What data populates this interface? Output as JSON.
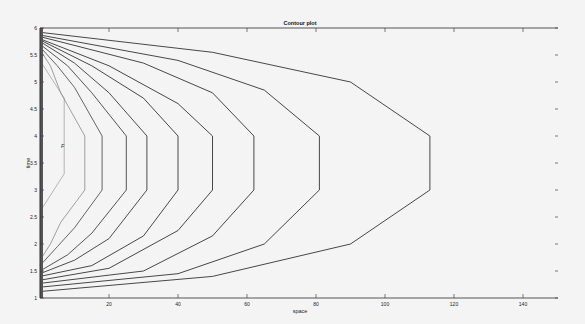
{
  "chart_data": {
    "type": "contour",
    "title": "Contour plot",
    "xlabel": "space",
    "ylabel": "time",
    "xlim": [
      0,
      150
    ],
    "ylim": [
      1,
      6
    ],
    "xticks": [
      20,
      40,
      60,
      80,
      100,
      120,
      140
    ],
    "yticks": [
      1,
      1.5,
      2,
      2.5,
      3,
      3.5,
      4,
      4.5,
      5,
      5.5,
      6
    ],
    "ytick_labels": [
      "1",
      "1.5",
      "2",
      "2.5",
      "3",
      "3.5",
      "4",
      "4.5",
      "5",
      "5.5",
      "6"
    ],
    "grid": false,
    "legend": null,
    "annotation": "F",
    "contours": [
      {
        "level_index": 1,
        "tip_x": 7,
        "color": "#9a9a9a",
        "points": [
          [
            0,
            5.4
          ],
          [
            4,
            5.0
          ],
          [
            7,
            4.7
          ],
          [
            7,
            3.3
          ],
          [
            4,
            3.0
          ],
          [
            0,
            2.6
          ]
        ]
      },
      {
        "level_index": 2,
        "tip_x": 13,
        "color": "#7a7a7a",
        "points": [
          [
            0,
            5.6
          ],
          [
            3,
            5.3
          ],
          [
            6,
            4.8
          ],
          [
            13,
            4.0
          ],
          [
            13,
            3.0
          ],
          [
            6,
            2.4
          ],
          [
            3,
            2.0
          ],
          [
            0,
            1.7
          ]
        ]
      },
      {
        "level_index": 3,
        "tip_x": 18,
        "color": "#555555",
        "points": [
          [
            0,
            5.65
          ],
          [
            5,
            5.3
          ],
          [
            10,
            4.9
          ],
          [
            18,
            4.0
          ],
          [
            18,
            3.0
          ],
          [
            10,
            2.3
          ],
          [
            5,
            1.95
          ],
          [
            0,
            1.6
          ]
        ]
      },
      {
        "level_index": 4,
        "tip_x": 25,
        "color": "#444444",
        "points": [
          [
            0,
            5.7
          ],
          [
            8,
            5.3
          ],
          [
            15,
            4.8
          ],
          [
            25,
            4.0
          ],
          [
            25,
            3.0
          ],
          [
            15,
            2.2
          ],
          [
            8,
            1.8
          ],
          [
            0,
            1.5
          ]
        ]
      },
      {
        "level_index": 5,
        "tip_x": 31,
        "color": "#3a3a3a",
        "points": [
          [
            0,
            5.75
          ],
          [
            10,
            5.35
          ],
          [
            20,
            4.8
          ],
          [
            31,
            4.0
          ],
          [
            31,
            3.0
          ],
          [
            20,
            2.1
          ],
          [
            10,
            1.7
          ],
          [
            0,
            1.45
          ]
        ]
      },
      {
        "level_index": 6,
        "tip_x": 40,
        "color": "#333333",
        "points": [
          [
            0,
            5.78
          ],
          [
            15,
            5.3
          ],
          [
            30,
            4.7
          ],
          [
            40,
            4.0
          ],
          [
            40,
            3.0
          ],
          [
            30,
            2.15
          ],
          [
            15,
            1.6
          ],
          [
            0,
            1.4
          ]
        ]
      },
      {
        "level_index": 7,
        "tip_x": 50,
        "color": "#333333",
        "points": [
          [
            0,
            5.8
          ],
          [
            20,
            5.3
          ],
          [
            40,
            4.6
          ],
          [
            50,
            4.0
          ],
          [
            50,
            3.0
          ],
          [
            40,
            2.25
          ],
          [
            20,
            1.55
          ],
          [
            0,
            1.33
          ]
        ]
      },
      {
        "level_index": 8,
        "tip_x": 62,
        "color": "#333333",
        "points": [
          [
            0,
            5.84
          ],
          [
            30,
            5.35
          ],
          [
            50,
            4.8
          ],
          [
            62,
            4.0
          ],
          [
            62,
            3.0
          ],
          [
            50,
            2.15
          ],
          [
            30,
            1.5
          ],
          [
            0,
            1.27
          ]
        ]
      },
      {
        "level_index": 9,
        "tip_x": 81,
        "color": "#333333",
        "points": [
          [
            0,
            5.87
          ],
          [
            40,
            5.4
          ],
          [
            65,
            4.85
          ],
          [
            81,
            4.0
          ],
          [
            81,
            3.0
          ],
          [
            65,
            2.0
          ],
          [
            40,
            1.45
          ],
          [
            0,
            1.2
          ]
        ]
      },
      {
        "level_index": 10,
        "tip_x": 113,
        "color": "#333333",
        "points": [
          [
            0,
            5.92
          ],
          [
            50,
            5.55
          ],
          [
            90,
            5.0
          ],
          [
            113,
            4.0
          ],
          [
            113,
            3.0
          ],
          [
            90,
            2.0
          ],
          [
            50,
            1.4
          ],
          [
            0,
            1.12
          ]
        ]
      }
    ]
  }
}
